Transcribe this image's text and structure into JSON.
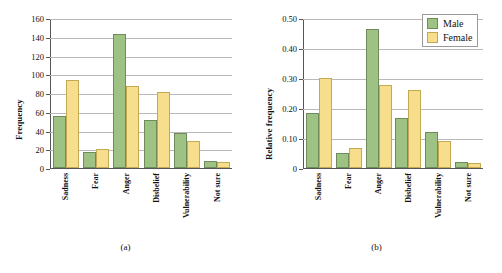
{
  "figure": {
    "panels": [
      {
        "caption": "(a)",
        "ylabel": "Frequency",
        "ytick_labels": [
          "160",
          "140",
          "120",
          "100",
          "80",
          "60",
          "40",
          "20",
          "0"
        ],
        "legend_visible": false
      },
      {
        "caption": "(b)",
        "ylabel": "Relative frequency",
        "ytick_labels": [
          "0.50",
          "0.40",
          "0.30",
          "0.20",
          "0.10",
          "0"
        ],
        "legend_visible": true
      }
    ],
    "legend": {
      "items": [
        {
          "label": "Male",
          "color": "#9dc283",
          "key": "male"
        },
        {
          "label": "Female",
          "color": "#f6de8c",
          "key": "female"
        }
      ]
    }
  },
  "chart_data": [
    {
      "type": "bar",
      "title": "",
      "panel_caption": "(a)",
      "categories": [
        "Sadness",
        "Fear",
        "Anger",
        "Disbelief",
        "Vulnerability",
        "Not sure"
      ],
      "series": [
        {
          "name": "Male",
          "color": "#9dc283",
          "values": [
            56,
            17,
            143,
            51,
            37,
            7
          ]
        },
        {
          "name": "Female",
          "color": "#f6de8c",
          "values": [
            94,
            20,
            88,
            81,
            29,
            6
          ]
        }
      ],
      "xlabel": "",
      "ylabel": "Frequency",
      "ylim": [
        0,
        160
      ],
      "ytick_values": [
        0,
        20,
        40,
        60,
        80,
        100,
        120,
        140,
        160
      ],
      "grid": true,
      "legend_position": "none"
    },
    {
      "type": "bar",
      "title": "",
      "panel_caption": "(b)",
      "categories": [
        "Sadness",
        "Fear",
        "Anger",
        "Disbelief",
        "Vulnerability",
        "Not sure"
      ],
      "series": [
        {
          "name": "Male",
          "color": "#9dc283",
          "values": [
            0.182,
            0.05,
            0.465,
            0.166,
            0.12,
            0.019
          ]
        },
        {
          "name": "Female",
          "color": "#f6de8c",
          "values": [
            0.3,
            0.067,
            0.277,
            0.259,
            0.09,
            0.016
          ]
        }
      ],
      "xlabel": "",
      "ylabel": "Relative frequency",
      "ylim": [
        0,
        0.5
      ],
      "ytick_values": [
        0,
        0.1,
        0.2,
        0.3,
        0.4,
        0.5
      ],
      "grid": true,
      "legend_position": "top-right"
    }
  ]
}
